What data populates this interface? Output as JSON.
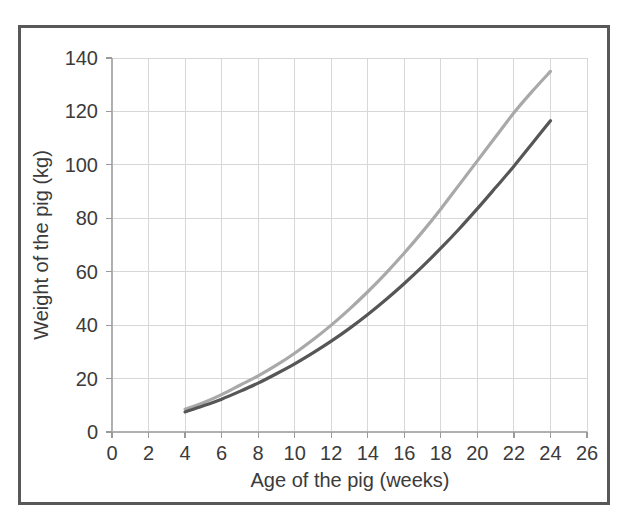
{
  "chart_data": {
    "type": "line",
    "title": "",
    "xlabel": "Age of the pig (weeks)",
    "ylabel": "Weight of the pig (kg)",
    "xlim": [
      0,
      26
    ],
    "ylim": [
      0,
      140
    ],
    "xticks": [
      0,
      2,
      4,
      6,
      8,
      10,
      12,
      14,
      16,
      18,
      20,
      22,
      24,
      26
    ],
    "yticks": [
      0,
      20,
      40,
      60,
      80,
      100,
      120,
      140
    ],
    "xtick_labels": [
      "0",
      "2",
      "4",
      "6",
      "8",
      "10",
      "12",
      "14",
      "16",
      "18",
      "20",
      "22",
      "24",
      "26"
    ],
    "ytick_labels": [
      "0",
      "20",
      "40",
      "60",
      "80",
      "100",
      "120",
      "140"
    ],
    "grid": true,
    "legend": "none",
    "x": [
      4,
      5,
      6,
      7,
      8,
      9,
      10,
      11,
      12,
      13,
      14,
      15,
      16,
      17,
      18,
      19,
      20,
      21,
      22,
      23,
      24
    ],
    "series": [
      {
        "name": "upper-curve",
        "color": "#a9a9a9",
        "values": [
          8.5,
          11.0,
          14.0,
          17.5,
          21.0,
          25.0,
          29.5,
          34.5,
          40.0,
          46.0,
          52.5,
          59.5,
          67.0,
          75.0,
          83.5,
          92.5,
          101.5,
          110.5,
          119.5,
          127.5,
          135.0
        ]
      },
      {
        "name": "lower-curve",
        "color": "#565656",
        "values": [
          7.5,
          9.8,
          12.3,
          15.2,
          18.3,
          21.8,
          25.5,
          29.6,
          34.0,
          38.8,
          44.0,
          49.6,
          55.6,
          62.0,
          68.8,
          76.0,
          83.6,
          91.5,
          99.5,
          108.0,
          116.5
        ]
      }
    ]
  },
  "figure": {
    "background_color": "#ffffff",
    "border_color": "#585858",
    "grid_color": "#d7d7d7",
    "text_color": "#3b3b3b"
  }
}
